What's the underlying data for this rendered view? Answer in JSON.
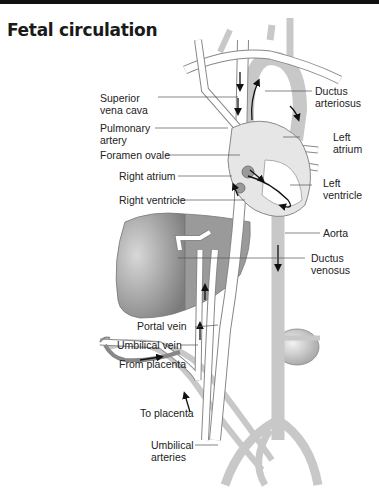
{
  "header": {
    "title": "Fetal circulation"
  },
  "labels": {
    "superior_vena_cava": [
      "Superior",
      "vena cava"
    ],
    "pulmonary_artery": [
      "Pulmonary",
      "artery"
    ],
    "foramen_ovale": "Foramen ovale",
    "right_atrium": "Right atrium",
    "right_ventricle": "Right ventricle",
    "ductus_arteriosus": [
      "Ductus",
      "arteriosus"
    ],
    "left_atrium": [
      "Left",
      "atrium"
    ],
    "left_ventricle": [
      "Left",
      "ventricle"
    ],
    "aorta": "Aorta",
    "ductus_venosus": [
      "Ductus",
      "venosus"
    ],
    "portal_vein": "Portal vein",
    "umbilical_vein": "Umbilical vein",
    "from_placenta": "From placenta",
    "to_placenta": "To placenta",
    "umbilical_arteries": [
      "Umbilical",
      "arteries"
    ]
  },
  "colors": {
    "artery": "#c8c8c8",
    "vein": "#ffffff",
    "outline": "#888888",
    "organ": "#9a9a9a",
    "leader": "#555555"
  }
}
